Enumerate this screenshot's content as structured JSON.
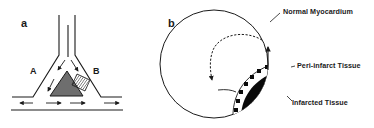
{
  "figure": {
    "panel_a": {
      "label": "a",
      "branch_labels": {
        "left": "A",
        "right": "B"
      },
      "elements": [
        "branching-vessel",
        "triangle-obstacle",
        "hatched-block",
        "flow-arrows"
      ]
    },
    "panel_b": {
      "label": "b",
      "annotations": {
        "normal": "Normal Myocardium",
        "peri": "Peri-infarct Tissue",
        "infarcted": "Infarcted Tissue"
      },
      "elements": [
        "myocardium-circle",
        "infarct-region",
        "peri-infarct-band",
        "dashed-reentry-arrow",
        "solid-arrow"
      ]
    },
    "colors": {
      "line": "#1a1a1a",
      "triangle_fill": "#6e6e6e",
      "infarct_fill": "#0a0a0a",
      "background": "#ffffff"
    }
  }
}
